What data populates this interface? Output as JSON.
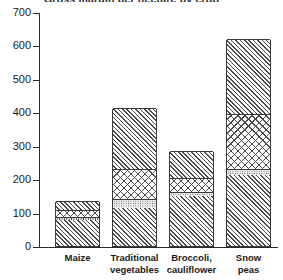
{
  "chart_data": {
    "type": "bar",
    "subtype": "stacked-bar",
    "title": "Gross margin per hectare by crop",
    "xlabel": "",
    "ylabel": "",
    "ylim": [
      0,
      700
    ],
    "yticks": [
      0,
      100,
      200,
      300,
      400,
      500,
      600,
      700
    ],
    "ytick_labels": [
      "0",
      "100",
      "200",
      "300",
      "400",
      "500",
      "600",
      "700"
    ],
    "grid": false,
    "legend": "none",
    "categories": [
      "Maize",
      "Traditional vegetables",
      "Broccoli, cauliflower",
      "Snow peas"
    ],
    "category_lines": [
      [
        "Maize"
      ],
      [
        "Traditional",
        "vegetables"
      ],
      [
        "Broccoli,",
        "cauliflower"
      ],
      [
        "Snow",
        "peas"
      ]
    ],
    "series": [
      {
        "name": "segment-1-diagonal-lower",
        "pattern": "diagonal-hatch",
        "values": [
          78,
          115,
          150,
          212
        ]
      },
      {
        "name": "segment-2-dotted",
        "pattern": "dotted",
        "values": [
          8,
          25,
          12,
          17
        ]
      },
      {
        "name": "segment-3-crosshatch",
        "pattern": "cross-hatch",
        "values": [
          22,
          90,
          42,
          165
        ]
      },
      {
        "name": "segment-4-diagonal-upper",
        "pattern": "diagonal-hatch",
        "values": [
          27,
          183,
          81,
          226
        ]
      }
    ],
    "totals": [
      135,
      413,
      285,
      620
    ]
  },
  "axis": {
    "y_tick_labels": [
      "700",
      "600",
      "500",
      "400",
      "300",
      "200",
      "100",
      "0"
    ]
  }
}
